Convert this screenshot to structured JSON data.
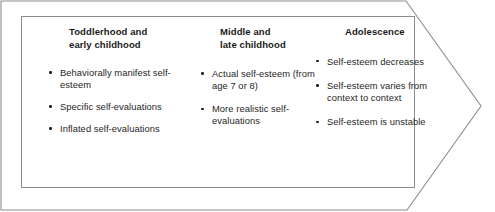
{
  "figure": {
    "shape": "right-arrow-banner",
    "outline_color": "#8c8c8c",
    "background_color": "#ffffff",
    "text_color": "#1f1f1f"
  },
  "columns": [
    {
      "heading_line_1": "Toddlerhood and",
      "heading_line_2": "early childhood",
      "bullets": [
        "Behaviorally manifest self-esteem",
        "Specific self-evaluations",
        "Inflated self-evaluations"
      ]
    },
    {
      "heading_line_1": "Middle and",
      "heading_line_2": "late childhood",
      "bullets": [
        "Actual self-esteem (from age 7 or 8)",
        "More realistic self-evaluations"
      ]
    },
    {
      "heading_line_1": "Adolescence",
      "heading_line_2": "",
      "bullets": [
        "Self-esteem decreases",
        "Self-esteem varies from context to context",
        "Self-esteem is unstable"
      ]
    }
  ]
}
